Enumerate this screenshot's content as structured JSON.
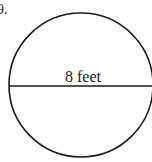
{
  "problem": {
    "number_label": "9."
  },
  "diagram": {
    "shape": "circle",
    "diameter_label": "8 feet",
    "stroke_color": "#1a1a1a",
    "background": "#ffffff"
  }
}
